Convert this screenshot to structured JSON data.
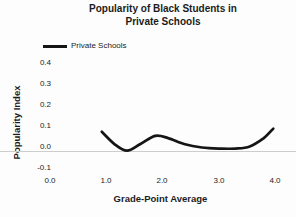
{
  "title": {
    "line1": "Popularity of Black Students in",
    "line2": "Private Schools"
  },
  "legend": {
    "label": "Private Schools"
  },
  "axes": {
    "y_label": "Popularity Index",
    "x_label": "Grade-Point Average",
    "y_ticks": [
      "0.4",
      "0.3",
      "0.2",
      "0.1",
      "0.0",
      "-0.1"
    ],
    "x_ticks": [
      "0.0",
      "1.0",
      "2.0",
      "3.0",
      "4.0"
    ]
  },
  "colors": {
    "line": "#151515",
    "text": "#1c1c1c",
    "zero_line": "#cdcdcd",
    "background": "#fdfdfd"
  },
  "chart_data": {
    "type": "line",
    "title": "Popularity of Black Students in Private Schools",
    "xlabel": "Grade-Point Average",
    "ylabel": "Popularity Index",
    "xlim": [
      0.0,
      4.0
    ],
    "ylim": [
      -0.1,
      0.4
    ],
    "x_ticks": [
      0.0,
      1.0,
      2.0,
      3.0,
      4.0
    ],
    "y_ticks": [
      -0.1,
      0.0,
      0.1,
      0.2,
      0.3,
      0.4
    ],
    "grid": false,
    "legend_position": "top-left",
    "series": [
      {
        "name": "Private Schools",
        "x": [
          0.92,
          1.15,
          1.37,
          1.6,
          1.87,
          2.1,
          2.4,
          2.7,
          3.0,
          3.3,
          3.55,
          3.8,
          3.97
        ],
        "y": [
          0.075,
          0.015,
          -0.015,
          0.015,
          0.055,
          0.045,
          0.015,
          0.0,
          -0.005,
          -0.005,
          0.005,
          0.045,
          0.09
        ]
      }
    ]
  }
}
